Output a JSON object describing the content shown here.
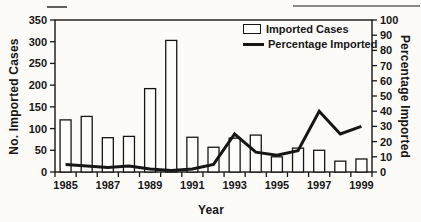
{
  "style": {
    "ink": "#161616",
    "background": "#fcfbf8",
    "bar_fill": "#fdfdfb",
    "line_width_px": 3
  },
  "chart_data": {
    "type": "combo-bar-line",
    "categories": [
      "1985",
      "1986",
      "1987",
      "1988",
      "1989",
      "1990",
      "1991",
      "1992",
      "1993",
      "1994",
      "1995",
      "1996",
      "1997",
      "1998",
      "1999"
    ],
    "x_tick_labels_shown": [
      "1985",
      "1987",
      "1989",
      "1991",
      "1993",
      "1995",
      "1997",
      "1999"
    ],
    "xlabel": "Year",
    "left_axis": {
      "label": "No. Imported Cases",
      "min": 0,
      "max": 350,
      "step": 50
    },
    "right_axis": {
      "label": "Percentage Imported",
      "min": 0,
      "max": 100,
      "step": 10
    },
    "series": [
      {
        "name": "Imported Cases",
        "type": "bar",
        "axis": "left",
        "values": [
          120,
          128,
          79,
          82,
          192,
          303,
          80,
          57,
          78,
          85,
          35,
          55,
          50,
          25,
          30
        ]
      },
      {
        "name": "Percentage Imported",
        "type": "line",
        "axis": "right",
        "values": [
          5,
          4,
          3,
          4,
          2,
          1,
          2,
          5,
          25,
          13,
          11,
          14,
          40,
          25,
          30
        ]
      }
    ],
    "legend": {
      "position": "top-right-inside",
      "entries": [
        "Imported Cases",
        "Percentage Imported"
      ]
    },
    "grid": false
  }
}
